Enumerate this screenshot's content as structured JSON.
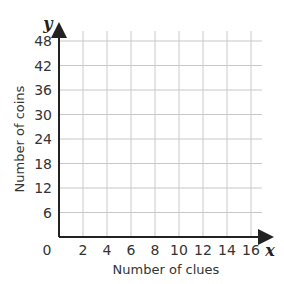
{
  "chart_data": {
    "type": "scatter",
    "title": "",
    "xlabel": "Number of clues",
    "ylabel": "Number of coins",
    "x_var": "x",
    "y_var": "y",
    "origin_label": "0",
    "x_ticks": [
      "2",
      "4",
      "6",
      "8",
      "10",
      "12",
      "14",
      "16"
    ],
    "y_ticks": [
      "6",
      "12",
      "18",
      "24",
      "30",
      "36",
      "42",
      "48"
    ],
    "xlim": [
      0,
      16
    ],
    "ylim": [
      0,
      48
    ],
    "grid": true,
    "series": []
  },
  "colors": {
    "axis": "#222222",
    "grid": "#c8c8c8",
    "text": "#333333"
  }
}
